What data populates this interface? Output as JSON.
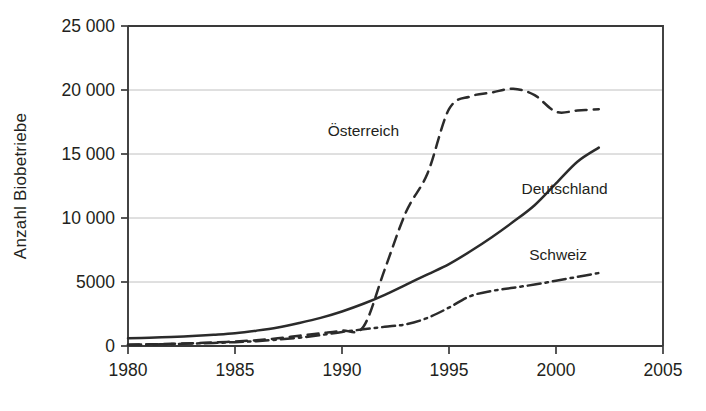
{
  "chart_data": {
    "type": "line",
    "title": "",
    "xlabel": "",
    "ylabel": "Anzahl Biobetriebe",
    "xlim": [
      1980,
      2005
    ],
    "ylim": [
      0,
      25000
    ],
    "grid": true,
    "legend_position": "inline-annotations",
    "x_ticks": [
      "1980",
      "1985",
      "1990",
      "1995",
      "2000",
      "2005"
    ],
    "x_tick_values": [
      1980,
      1985,
      1990,
      1995,
      2000,
      2005
    ],
    "y_ticks": [
      "0",
      "5000",
      "10 000",
      "15 000",
      "20 000",
      "25 000"
    ],
    "y_tick_values": [
      0,
      5000,
      10000,
      15000,
      20000,
      25000
    ],
    "series": [
      {
        "name": "Österreich",
        "style": "dashed",
        "label_x": 1991.0,
        "label_y": 16400,
        "x": [
          1980,
          1981,
          1982,
          1983,
          1984,
          1985,
          1986,
          1987,
          1988,
          1989,
          1990,
          1991,
          1992,
          1993,
          1994,
          1995,
          1996,
          1997,
          1998,
          1999,
          2000,
          2001,
          2002
        ],
        "values": [
          100,
          130,
          170,
          220,
          280,
          350,
          450,
          600,
          800,
          1000,
          1200,
          1500,
          6000,
          10500,
          13500,
          18500,
          19500,
          19800,
          20100,
          19600,
          18300,
          18400,
          18500
        ]
      },
      {
        "name": "Deutschland",
        "style": "solid",
        "label_x": 2000.4,
        "label_y": 11900,
        "x": [
          1980,
          1981,
          1982,
          1983,
          1984,
          1985,
          1986,
          1987,
          1988,
          1989,
          1990,
          1991,
          1992,
          1993,
          1994,
          1995,
          1996,
          1997,
          1998,
          1999,
          2000,
          2001,
          2002
        ],
        "values": [
          600,
          650,
          700,
          780,
          880,
          1000,
          1200,
          1450,
          1800,
          2200,
          2700,
          3300,
          4000,
          4800,
          5600,
          6400,
          7400,
          8500,
          9700,
          11000,
          12700,
          14400,
          15500
        ]
      },
      {
        "name": "Schweiz",
        "style": "dash-dot",
        "label_x": 2000.1,
        "label_y": 6750,
        "x": [
          1980,
          1981,
          1982,
          1983,
          1984,
          1985,
          1986,
          1987,
          1988,
          1989,
          1990,
          1991,
          1992,
          1993,
          1994,
          1995,
          1996,
          1997,
          1998,
          1999,
          2000,
          2001,
          2002
        ],
        "values": [
          100,
          120,
          150,
          190,
          240,
          300,
          380,
          500,
          650,
          850,
          1100,
          1300,
          1500,
          1700,
          2200,
          3000,
          3900,
          4300,
          4550,
          4800,
          5100,
          5400,
          5700
        ]
      }
    ]
  }
}
